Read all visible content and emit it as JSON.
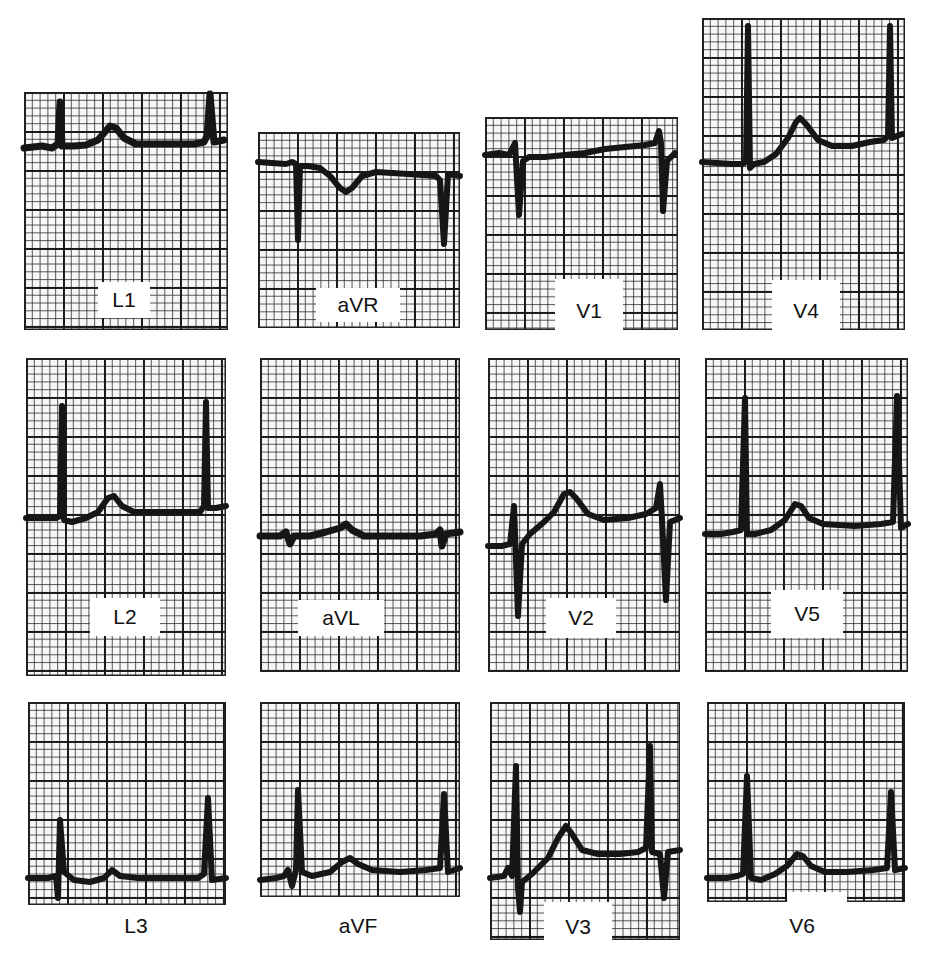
{
  "figure": {
    "leads": {
      "L1": {
        "label": "L1"
      },
      "aVR": {
        "label": "aVR"
      },
      "V1": {
        "label": "V1"
      },
      "V4": {
        "label": "V4"
      },
      "L2": {
        "label": "L2"
      },
      "aVL": {
        "label": "aVL"
      },
      "V2": {
        "label": "V2"
      },
      "V5": {
        "label": "V5"
      },
      "L3": {
        "label": "L3"
      },
      "aVF": {
        "label": "aVF"
      },
      "V3": {
        "label": "V3"
      },
      "V6": {
        "label": "V6"
      }
    },
    "layout": [
      [
        "L1",
        "aVR",
        "V1",
        "V4"
      ],
      [
        "L2",
        "aVL",
        "V2",
        "V5"
      ],
      [
        "L3",
        "aVF",
        "V3",
        "V6"
      ]
    ],
    "colors": {
      "grid": "#1a1a1a",
      "paper": "#f7f7f5",
      "trace": "#161616"
    }
  }
}
